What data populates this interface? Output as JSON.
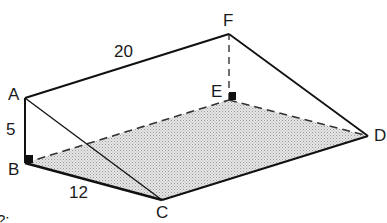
{
  "diagram": {
    "type": "triangular-prism (wedge) geometry figure",
    "vertices": {
      "A": {
        "label": "A",
        "x": 25,
        "y": 98
      },
      "B": {
        "label": "B",
        "x": 25,
        "y": 163
      },
      "C": {
        "label": "C",
        "x": 162,
        "y": 200
      },
      "D": {
        "label": "D",
        "x": 368,
        "y": 136
      },
      "E": {
        "label": "E",
        "x": 229,
        "y": 100
      },
      "F": {
        "label": "F",
        "x": 229,
        "y": 34
      }
    },
    "measurements": {
      "AF": "20",
      "AB": "5",
      "BC": "12"
    },
    "shaded_face": [
      "B",
      "C",
      "D",
      "E"
    ],
    "solid_edges": [
      [
        "A",
        "F"
      ],
      [
        "F",
        "D"
      ],
      [
        "A",
        "B"
      ],
      [
        "B",
        "C"
      ],
      [
        "C",
        "D"
      ],
      [
        "A",
        "C"
      ]
    ],
    "dashed_edges": [
      [
        "B",
        "E"
      ],
      [
        "E",
        "D"
      ],
      [
        "E",
        "F"
      ]
    ],
    "right_angle_marks": [
      "B",
      "E"
    ],
    "partial_text": "?:",
    "colors": {
      "line": "#111111",
      "shade": "#d9d9d9",
      "background": "#ffffff"
    }
  }
}
